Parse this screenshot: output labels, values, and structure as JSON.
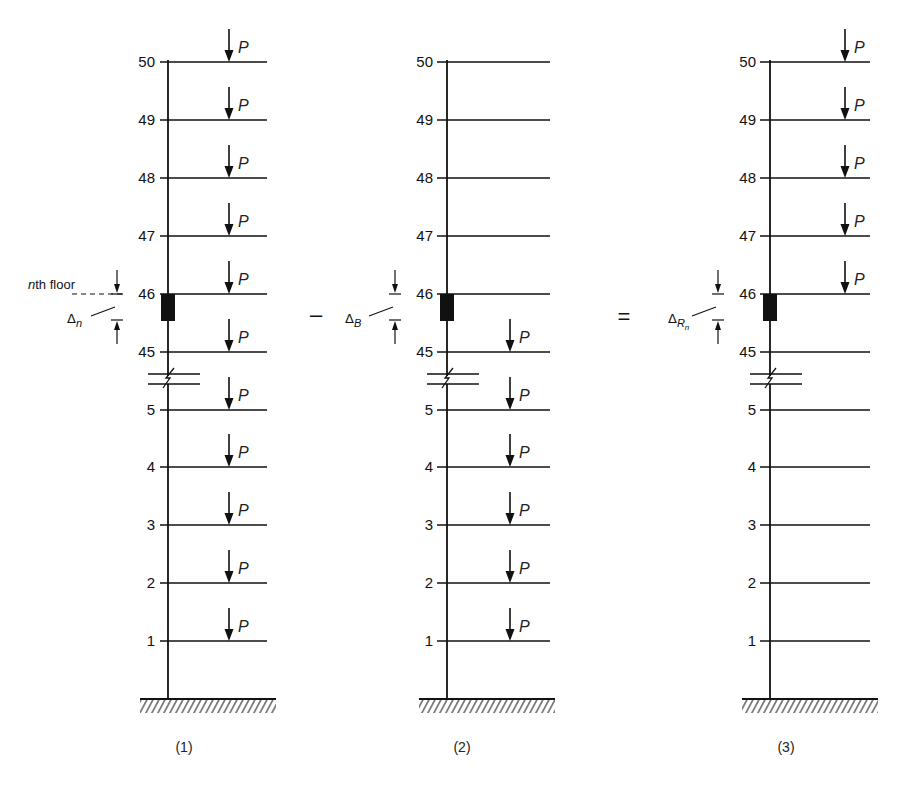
{
  "figure": {
    "floor_labels_top": [
      "50",
      "49",
      "48",
      "47",
      "46",
      "45"
    ],
    "floor_labels_bottom": [
      "5",
      "4",
      "3",
      "2",
      "1"
    ],
    "load_label": "P",
    "operators": {
      "minus": "–",
      "equals": "="
    },
    "panels": [
      {
        "id": "1",
        "caption": "(1)",
        "loaded_floors": [
          "50",
          "49",
          "48",
          "47",
          "46",
          "45",
          "5",
          "4",
          "3",
          "2",
          "1"
        ],
        "annotation_floor": "nth floor",
        "annotation_floor_n": "n",
        "annotation_floor_rest": "th floor",
        "delta_symbol": "Δ",
        "delta_sub": "n"
      },
      {
        "id": "2",
        "caption": "(2)",
        "loaded_floors": [
          "45",
          "5",
          "4",
          "3",
          "2",
          "1"
        ],
        "delta_symbol": "Δ",
        "delta_sub": "B"
      },
      {
        "id": "3",
        "caption": "(3)",
        "loaded_floors": [
          "50",
          "49",
          "48",
          "47",
          "46"
        ],
        "delta_symbol": "Δ",
        "delta_sub": "R",
        "delta_subsub": "n"
      }
    ]
  }
}
